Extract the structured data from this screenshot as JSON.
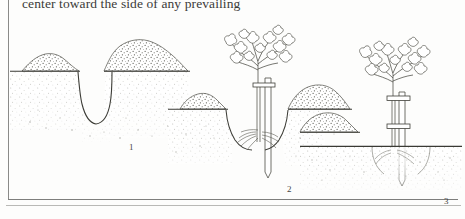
{
  "page": {
    "background_color": "#fdfdfc",
    "ink_color": "#4a4a46",
    "frame_color": "#8a8a88"
  },
  "body_text": {
    "line": "center toward the side of any prevailing"
  },
  "figure": {
    "style": "stippled pen-and-ink cross-section",
    "panels": [
      {
        "number": "1",
        "caption_number": "1",
        "stage": "hole dug with excavated soil mounded on both sides",
        "has_tree": false,
        "has_stake": false,
        "hole_open": true
      },
      {
        "number": "2",
        "caption_number": "2",
        "stage": "tree and stake positioned in open hole with roots spread",
        "has_tree": true,
        "has_stake": true,
        "hole_open": true
      },
      {
        "number": "3",
        "caption_number": "3",
        "stage": "hole backfilled, soil firmed level, tree tied to stake",
        "has_tree": true,
        "has_stake": true,
        "hole_open": false
      }
    ],
    "elements": {
      "ground_line_label": "ground level",
      "soil_mound_label": "excavated soil mound",
      "stake_label": "wooden stake",
      "tie_label": "tree tie",
      "roots_label": "root ball",
      "foliage_label": "foliage"
    }
  }
}
